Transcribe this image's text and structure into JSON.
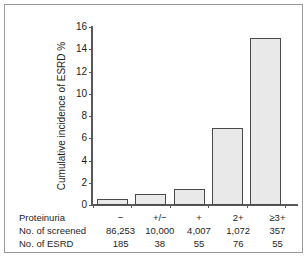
{
  "chart_data": {
    "type": "bar",
    "title": "",
    "xlabel": "Proteinuria",
    "ylabel": "Cumulative incidence of ESRD %",
    "categories": [
      "−",
      "+/−",
      "+",
      "2+",
      "≥3+"
    ],
    "values": [
      0.5,
      0.95,
      1.45,
      6.9,
      15.0
    ],
    "ylim": [
      0,
      16
    ],
    "yticks": [
      0,
      2,
      4,
      6,
      8,
      10,
      12,
      14,
      16
    ],
    "ytick_labels": [
      "0",
      "2",
      "4",
      "6",
      "8",
      "10",
      "12",
      "14",
      "16"
    ],
    "grid": false,
    "legend": null,
    "bar_fill": "#e9e9e9",
    "bar_edge": "#4a4a4a",
    "axis_color": "#58585a"
  },
  "table": {
    "rows": [
      {
        "label": "Proteinuria",
        "cells": [
          "−",
          "+/−",
          "+",
          "2+",
          "≥3+"
        ]
      },
      {
        "label": "No. of screened",
        "cells": [
          "86,253",
          "10,000",
          "4,007",
          "1,072",
          "357"
        ]
      },
      {
        "label": "No. of ESRD",
        "cells": [
          "185",
          "38",
          "55",
          "76",
          "55"
        ]
      }
    ]
  }
}
